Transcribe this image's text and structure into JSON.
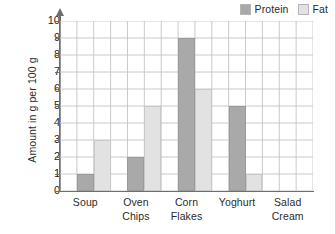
{
  "chart_data": {
    "type": "bar",
    "title": "",
    "subtitle": "",
    "xlabel": "",
    "ylabel": "Amount in g per 100 g",
    "ylim": [
      0,
      10
    ],
    "ytick_labels": [
      "10",
      "9",
      "8",
      "7",
      "6",
      "5",
      "4",
      "3",
      "2",
      "1",
      "0"
    ],
    "ytick_values": [
      10,
      9,
      8,
      7,
      6,
      5,
      4,
      3,
      2,
      1,
      0
    ],
    "grid": true,
    "legend_position": "top-right",
    "categories": [
      "Soup",
      "Oven Chips",
      "Corn Flakes",
      "Yoghurt",
      "Salad Cream"
    ],
    "category_lines": [
      [
        "Soup"
      ],
      [
        "Oven",
        "Chips"
      ],
      [
        "Corn",
        "Flakes"
      ],
      [
        "Yoghurt"
      ],
      [
        "Salad",
        "Cream"
      ]
    ],
    "series": [
      {
        "name": "Protein",
        "color": "#a9a9a9",
        "values": [
          1,
          2,
          9,
          5,
          0
        ]
      },
      {
        "name": "Fat",
        "color": "#e2e2e2",
        "values": [
          3,
          5,
          6,
          1,
          0
        ]
      }
    ]
  },
  "legend": {
    "entries": [
      {
        "label": "Protein",
        "color": "#a9a9a9"
      },
      {
        "label": "Fat",
        "color": "#e2e2e2"
      }
    ]
  },
  "colors": {
    "protein": "#a9a9a9",
    "fat": "#e2e2e2",
    "axis": "#6d6e71",
    "grid": "#c4c4c4",
    "text": "#231f20",
    "background": "#ffffff"
  }
}
